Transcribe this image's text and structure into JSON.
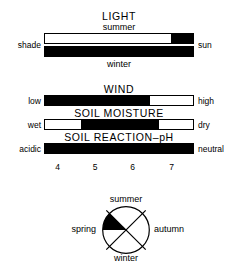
{
  "figure": {
    "caption_present": false,
    "ink_color": "#000000",
    "background": "#ffffff"
  },
  "chart_data": {
    "type": "bar",
    "title": "",
    "orientation": "horizontal",
    "panels": [
      {
        "id": "light",
        "title": "LIGHT",
        "left_label": "shade",
        "right_label": "sun",
        "bars": [
          {
            "label": "summer",
            "label_position": "above",
            "range_start_pct": 85,
            "range_end_pct": 100,
            "fill": "#000000"
          },
          {
            "label": "winter",
            "label_position": "below",
            "range_start_pct": 0,
            "range_end_pct": 100,
            "fill": "#000000"
          }
        ]
      },
      {
        "id": "wind",
        "title": "WIND",
        "left_label": "low",
        "right_label": "high",
        "bars": [
          {
            "label": "",
            "label_position": "none",
            "range_start_pct": 0,
            "range_end_pct": 71,
            "fill": "#000000"
          }
        ]
      },
      {
        "id": "soil-moisture",
        "title": "SOIL MOISTURE",
        "left_label": "wet",
        "right_label": "dry",
        "bars": [
          {
            "label": "",
            "label_position": "none",
            "range_start_pct": 24,
            "range_end_pct": 77,
            "fill": "#000000"
          }
        ]
      },
      {
        "id": "soil-reaction-ph",
        "title": "SOIL REACTION–pH",
        "left_label": "acidic",
        "right_label": "neutral",
        "bars": [
          {
            "label": "",
            "label_position": "none",
            "range_start_pct": 0,
            "range_end_pct": 100,
            "fill": "#000000"
          }
        ],
        "axis": {
          "ticks": [
            "4",
            "5",
            "6",
            "7"
          ],
          "tick_pct": [
            9,
            34,
            59,
            85
          ],
          "range": [
            3.6,
            7.4
          ]
        }
      }
    ],
    "season_wheel": {
      "type": "pie",
      "labels": {
        "top": "summer",
        "right": "autumn",
        "bottom": "winter",
        "left": "spring"
      },
      "slices": [
        {
          "name": "spring-summer",
          "start_deg": 292,
          "end_deg": 337,
          "fill": "#000000"
        }
      ],
      "spoke_angles_deg": [
        45,
        135,
        225,
        315
      ],
      "note": "flowering period wedge between spring and summer"
    }
  }
}
